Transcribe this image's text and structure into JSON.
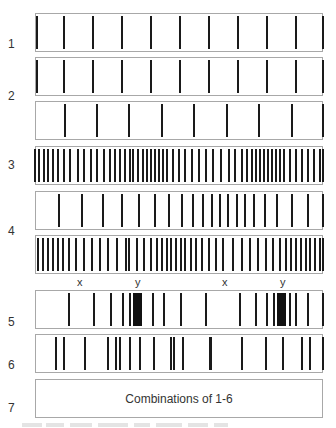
{
  "row_labels": [
    {
      "text": "1",
      "top": 37
    },
    {
      "text": "2",
      "top": 89
    },
    {
      "text": "3",
      "top": 158
    },
    {
      "text": "4",
      "top": 224
    },
    {
      "text": "5",
      "top": 315
    },
    {
      "text": "6",
      "top": 358
    },
    {
      "text": "7",
      "top": 401
    }
  ],
  "boxes": [
    {
      "id": "1",
      "top": 13,
      "bars": [
        63,
        92,
        121,
        150,
        179,
        208,
        237,
        266,
        295,
        322
      ],
      "left_edge_bar": true
    },
    {
      "id": "2a",
      "top": 57,
      "bars": [
        63,
        92,
        121,
        150,
        179,
        208,
        237,
        266,
        295,
        322
      ],
      "left_edge_bar": true
    },
    {
      "id": "2b",
      "top": 101,
      "bars": [
        64,
        96,
        128,
        161,
        193,
        226,
        258,
        291,
        322
      ]
    },
    {
      "id": "3",
      "top": 146,
      "bars": [
        34,
        38,
        43,
        47,
        52,
        57,
        63,
        69,
        77,
        83,
        90,
        96,
        103,
        109,
        114,
        119,
        124,
        129,
        132,
        137,
        142,
        146,
        150,
        154,
        158,
        162,
        166,
        172,
        178,
        184,
        191,
        198,
        205,
        212,
        220,
        228,
        234,
        241,
        246,
        251,
        255,
        259,
        263,
        267,
        271,
        275,
        279,
        283,
        289,
        295,
        301,
        307,
        313,
        319,
        322
      ]
    },
    {
      "id": "4a",
      "top": 191,
      "bars": [
        58,
        81,
        102,
        121,
        138,
        154,
        168,
        181,
        192,
        202,
        211,
        219,
        227,
        236,
        244,
        253,
        264,
        276,
        291,
        307,
        322
      ]
    },
    {
      "id": "4b",
      "top": 235,
      "bars": [
        37,
        42,
        47,
        52,
        57,
        62,
        68,
        75,
        83,
        91,
        99,
        107,
        116,
        125,
        128,
        136,
        143,
        150,
        156,
        161,
        166,
        170,
        175,
        180,
        184,
        190,
        195,
        201,
        208,
        215,
        222,
        232,
        241,
        249,
        257,
        265,
        272,
        279,
        285,
        290,
        295,
        300,
        305,
        309,
        314,
        319,
        322
      ]
    },
    {
      "id": "5",
      "top": 290,
      "bars": [
        68,
        93,
        110,
        122,
        129,
        152,
        163,
        180,
        205,
        239,
        255,
        266,
        273,
        289,
        295,
        307,
        322
      ],
      "clusters": [
        [
          133,
          142
        ],
        [
          277,
          286
        ]
      ]
    },
    {
      "id": "6",
      "top": 334,
      "bars": [
        55,
        63,
        84,
        107,
        115,
        119,
        129,
        139,
        153,
        170,
        173,
        182,
        209,
        241,
        265,
        282,
        301,
        309,
        322
      ],
      "thick": [
        209
      ]
    }
  ],
  "markers": [
    {
      "text": "x",
      "left": 77,
      "top": 276
    },
    {
      "text": "y",
      "left": 135,
      "top": 276
    },
    {
      "text": "x",
      "left": 222,
      "top": 276
    },
    {
      "text": "y",
      "left": 280,
      "top": 276
    }
  ],
  "box7": {
    "top": 379,
    "caption": "Combinations of 1-6"
  }
}
